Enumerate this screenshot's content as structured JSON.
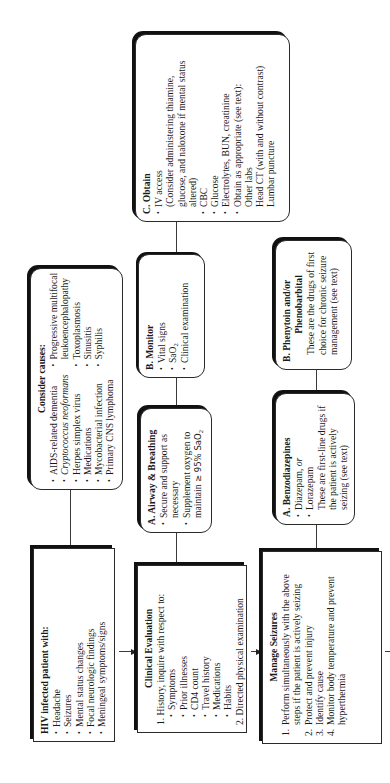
{
  "hiv_box": {
    "title": "HIV infected patient with:",
    "items": [
      "Headache",
      "Seizures",
      "Mental status changes",
      "Focal neurologic findings",
      "Meningeal symptoms/signs"
    ]
  },
  "causes_box": {
    "title": "Consider causes:",
    "col1": [
      "AIDS-related dementia",
      "Cryptococcus",
      "neoformans",
      "Herpes simplex virus",
      "Medications",
      "Mycobacterial infection",
      "Primary CNS lymphoma"
    ],
    "col2": [
      "Progressive multifocal",
      "leukoencephalopathy",
      "Toxoplasmosis",
      "Sinusitis",
      "Syphilis"
    ]
  },
  "clinical_box": {
    "title": "Clinical Evaluation",
    "step1": "1. History, inquire with respect to:",
    "items": [
      "Symptoms",
      "Prior illnesses",
      "CD4 count",
      "Travel history",
      "Medications",
      "Habits"
    ],
    "step2": "2. Directed physical examination"
  },
  "airway_box": {
    "title": "A. Airway & Breathing",
    "items": [
      "Secure and support as",
      "necessary",
      "Supplement oxygen to",
      "maintain",
      "≥ 95% SaO",
      "2"
    ]
  },
  "monitor_box": {
    "title": "B. Monitor",
    "items": [
      "Vital signs",
      "SaO",
      "2",
      "Clinical examination"
    ]
  },
  "obtain_box": {
    "title": "C. Obtain",
    "items": [
      "IV access",
      "(Consider administering thiamine,",
      "glucose, and naloxone if mental status",
      "altered)",
      "CBC",
      "Glucose",
      "Electrolytes, BUN, creatinine",
      "Obtain as appropriate  (see text):",
      "Other labs",
      "Head CT (with and without contrast)",
      "Lumbar puncture"
    ]
  },
  "seizures_box": {
    "title": "Manage Seizures",
    "steps": [
      {
        "num": "1.",
        "text": "Perform simultaneously with the above steps if the patient is actively seizing"
      },
      {
        "num": "2.",
        "text": "Protect and prevent injury"
      },
      {
        "num": "3.",
        "text": "Identify cause"
      },
      {
        "num": "4.",
        "text": "Monitor body temperature and prevent hyperthermia"
      }
    ]
  },
  "benzo_box": {
    "title": "A.  Benzodiazepines",
    "items": [
      "Diazepam,",
      "or",
      "Lorazepam"
    ],
    "note": "These are first-line drugs if the patient is actively seizing (see text)"
  },
  "pheny_box": {
    "title_line1": "B.  Phenytoin and/or",
    "title_line2": "Phenobarbital",
    "note": "These are the drugs of first choice for chronic seizure management (see text)"
  }
}
